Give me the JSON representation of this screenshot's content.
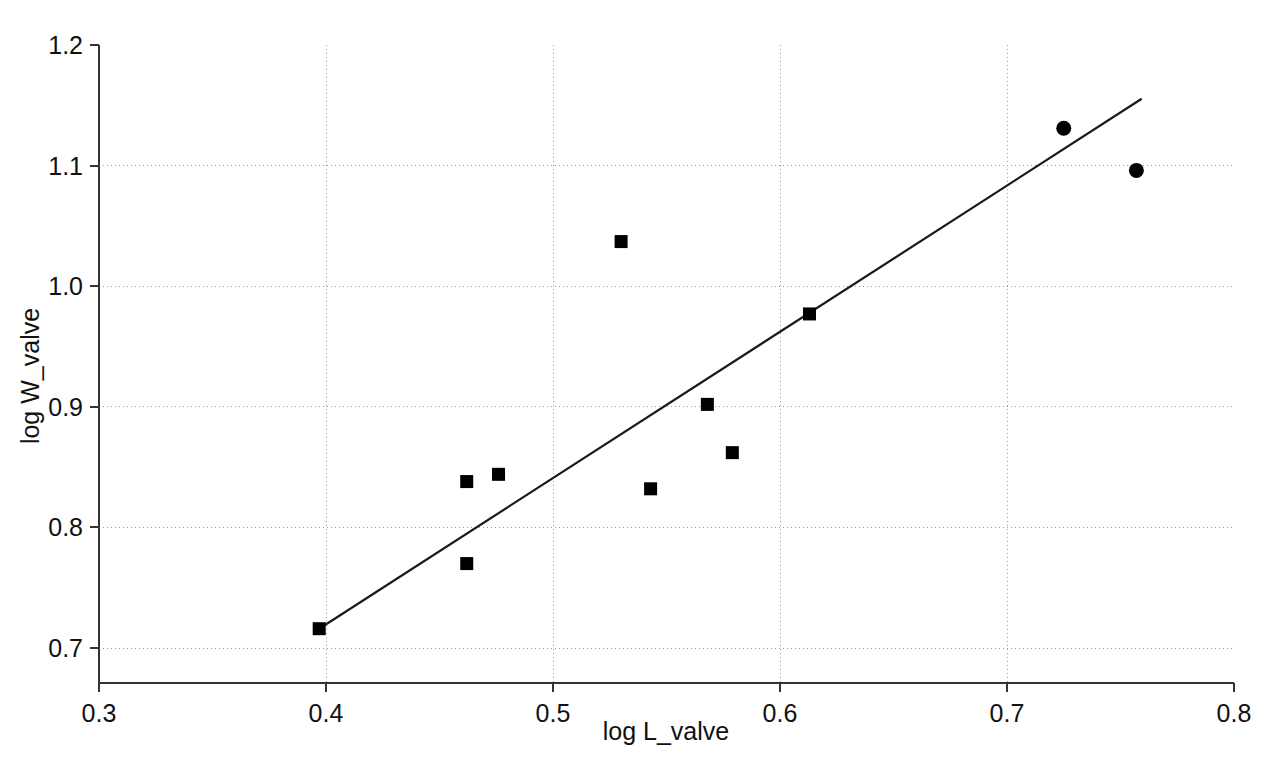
{
  "chart_data": {
    "type": "scatter",
    "title": "",
    "xlabel": "log L_valve",
    "ylabel": "log W_valve",
    "xlim": [
      0.3,
      0.8
    ],
    "ylim": [
      0.7,
      1.2
    ],
    "xticks": [
      "0.3",
      "0.4",
      "0.5",
      "0.6",
      "0.7",
      "0.8"
    ],
    "yticks": [
      "0.7",
      "0.8",
      "0.9",
      "1.0",
      "1.1",
      "1.2"
    ],
    "xtick_values": [
      0.3,
      0.4,
      0.5,
      0.6,
      0.7,
      0.8
    ],
    "ytick_values": [
      0.7,
      0.8,
      0.9,
      1.0,
      1.1,
      1.2
    ],
    "grid": true,
    "grid_style": "dotted",
    "grid_color": "#999999",
    "axis_color": "#333333",
    "marker_color": "#000000",
    "line_color": "#1a1a1a",
    "legend": null,
    "series": [
      {
        "name": "squares",
        "marker": "square",
        "marker_size": 13,
        "points": [
          {
            "x": 0.397,
            "y": 0.716
          },
          {
            "x": 0.462,
            "y": 0.838
          },
          {
            "x": 0.476,
            "y": 0.844
          },
          {
            "x": 0.462,
            "y": 0.77
          },
          {
            "x": 0.53,
            "y": 1.037
          },
          {
            "x": 0.543,
            "y": 0.832
          },
          {
            "x": 0.568,
            "y": 0.902
          },
          {
            "x": 0.579,
            "y": 0.862
          },
          {
            "x": 0.613,
            "y": 0.977
          }
        ]
      },
      {
        "name": "circles",
        "marker": "circle",
        "marker_size": 15,
        "points": [
          {
            "x": 0.725,
            "y": 1.131
          },
          {
            "x": 0.757,
            "y": 1.096
          }
        ]
      }
    ],
    "fit_line": {
      "name": "regression-line",
      "x0": 0.397,
      "y0": 0.716,
      "x1": 0.759,
      "y1": 1.155,
      "width": 2.2
    }
  }
}
